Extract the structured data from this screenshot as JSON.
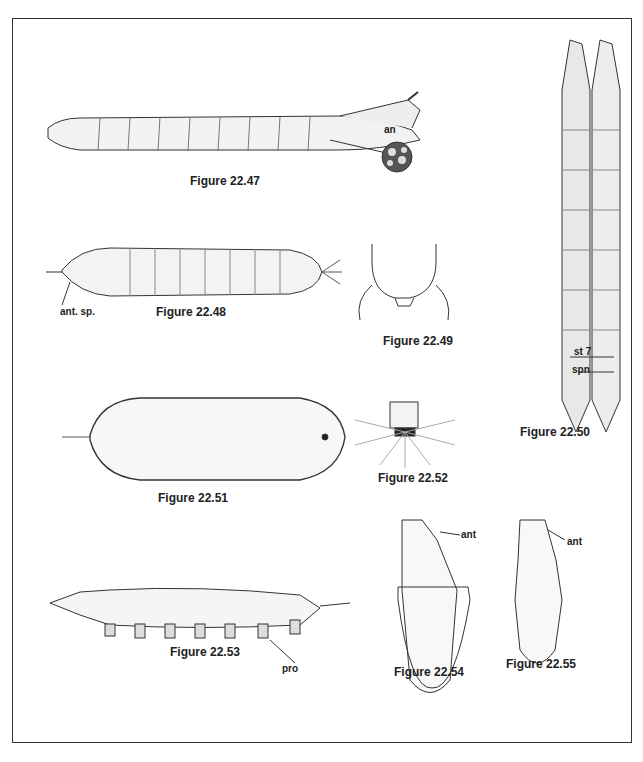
{
  "plate": {
    "figures": [
      {
        "id": "22.47",
        "caption": "Figure 22.47",
        "labels": [
          "an"
        ]
      },
      {
        "id": "22.48",
        "caption": "Figure 22.48",
        "labels": [
          "ant. sp."
        ]
      },
      {
        "id": "22.49",
        "caption": "Figure 22.49",
        "labels": []
      },
      {
        "id": "22.50",
        "caption": "Figure 22.50",
        "labels": [
          "st 7",
          "spn"
        ]
      },
      {
        "id": "22.51",
        "caption": "Figure 22.51",
        "labels": []
      },
      {
        "id": "22.52",
        "caption": "Figure 22.52",
        "labels": []
      },
      {
        "id": "22.53",
        "caption": "Figure 22.53",
        "labels": [
          "pro"
        ]
      },
      {
        "id": "22.54",
        "caption": "Figure 22.54",
        "labels": [
          "ant"
        ]
      },
      {
        "id": "22.55",
        "caption": "Figure 22.55",
        "labels": [
          "ant"
        ]
      }
    ]
  },
  "colors": {
    "ink": "#222222",
    "paper": "#ffffff",
    "shade": "#bbbbbb"
  }
}
